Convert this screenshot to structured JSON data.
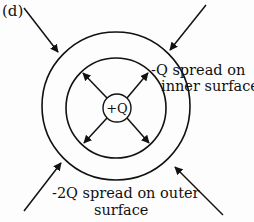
{
  "figure": {
    "panel_label": "(d)",
    "center_charge": "+Q",
    "inner_surface_label": {
      "line1": "-Q spread on",
      "line2": "inner surface"
    },
    "outer_surface_label": {
      "line1": "-2Q spread on outer",
      "line2": "surface"
    },
    "colors": {
      "stroke": "#111111",
      "background": "#fdfdfd"
    },
    "geometry": {
      "center": [
        116,
        108
      ],
      "outer_shell_radius": 74,
      "inner_shell_radius": 50,
      "charge_radius": 14
    },
    "field_arrows": {
      "external_inward": 4,
      "internal_outward": 4
    }
  }
}
